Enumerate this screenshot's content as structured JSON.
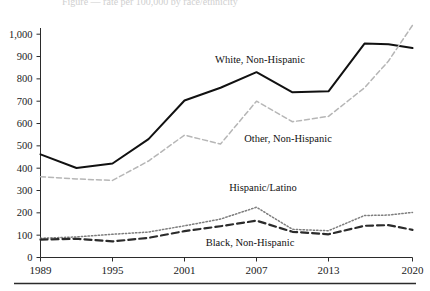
{
  "figure": {
    "background_color": "#ffffff",
    "axis_color": "#2b2b2b",
    "partial_top_title": "Figure — rate per 100,000 by race/ethnicity"
  },
  "axes": {
    "y_ticks": [
      "0",
      "100",
      "200",
      "300",
      "400",
      "500",
      "600",
      "700",
      "800",
      "900",
      "1,000"
    ],
    "x_ticks": [
      "1989",
      "1995",
      "2001",
      "2007",
      "2013",
      "2020"
    ]
  },
  "labels": {
    "white": "White, Non-Hispanic",
    "other": "Other, Non-Hispanic",
    "hispanic": "Hispanic/Latino",
    "black": "Black, Non-Hispanic"
  },
  "chart_data": {
    "type": "line",
    "title": "",
    "subtitle": "",
    "xlabel": "",
    "ylabel": "",
    "xlim": [
      1989,
      2020
    ],
    "ylim": [
      0,
      1000
    ],
    "y_tick_values": [
      0,
      100,
      200,
      300,
      400,
      500,
      600,
      700,
      800,
      900,
      1000
    ],
    "x_tick_values": [
      1989,
      1995,
      2001,
      2007,
      2013,
      2020
    ],
    "grid": false,
    "legend_position": "inline-annotations",
    "x": [
      1989,
      1992,
      1995,
      1998,
      2001,
      2004,
      2007,
      2010,
      2013,
      2016,
      2018,
      2020
    ],
    "series": [
      {
        "name": "White, Non-Hispanic",
        "style": "solid",
        "color": "#111111",
        "values": [
          462,
          401,
          421,
          530,
          703,
          760,
          830,
          740,
          744,
          958,
          955,
          938
        ]
      },
      {
        "name": "Other, Non-Hispanic",
        "style": "dashed",
        "color": "#b6b6b6",
        "values": [
          362,
          352,
          345,
          432,
          548,
          508,
          700,
          608,
          632,
          760,
          880,
          1040
        ]
      },
      {
        "name": "Hispanic/Latino",
        "style": "dotted",
        "color": "#7d7d7d",
        "values": [
          86,
          92,
          104,
          114,
          142,
          172,
          225,
          126,
          120,
          188,
          190,
          202
        ]
      },
      {
        "name": "Black, Non-Hispanic",
        "style": "long-dash",
        "color": "#2b2b2b",
        "values": [
          80,
          84,
          72,
          88,
          118,
          140,
          165,
          115,
          104,
          142,
          145,
          124
        ]
      }
    ]
  },
  "annotations": [
    {
      "text": "White, Non-Hispanic",
      "x": 260,
      "y": 63
    },
    {
      "text": "Other, Non-Hispanic",
      "x": 288,
      "y": 142
    },
    {
      "text": "Hispanic/Latino",
      "x": 263,
      "y": 191
    },
    {
      "text": "Black, Non-Hispanic",
      "x": 250,
      "y": 246
    }
  ]
}
